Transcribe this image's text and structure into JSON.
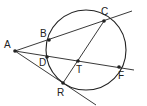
{
  "diagram": {
    "type": "geometry",
    "stroke_color": "#222222",
    "circle": {
      "cx": 86,
      "cy": 50,
      "r": 40
    },
    "points": [
      {
        "id": "A",
        "label": "A",
        "x": 15,
        "y": 51,
        "lx": 4,
        "ly": 48
      },
      {
        "id": "B",
        "label": "B",
        "x": 49,
        "y": 40,
        "lx": 40,
        "ly": 37
      },
      {
        "id": "C",
        "label": "C",
        "x": 104,
        "y": 21,
        "lx": 101,
        "ly": 15
      },
      {
        "id": "D",
        "label": "D",
        "x": 47,
        "y": 57,
        "lx": 39,
        "ly": 66
      },
      {
        "id": "T",
        "label": "T",
        "x": 78,
        "y": 61,
        "lx": 76,
        "ly": 73
      },
      {
        "id": "F",
        "label": "F",
        "x": 119,
        "y": 67,
        "lx": 118,
        "ly": 79
      },
      {
        "id": "R",
        "label": "R",
        "x": 63,
        "y": 83,
        "lx": 57,
        "ly": 96
      }
    ],
    "lines": [
      {
        "name": "secant-ABC",
        "x1": 15,
        "y1": 51,
        "x2": 132,
        "y2": 11
      },
      {
        "name": "secant-ADF",
        "x1": 15,
        "y1": 51,
        "x2": 134,
        "y2": 70
      },
      {
        "name": "tangent-AR",
        "x1": 15,
        "y1": 51,
        "x2": 96,
        "y2": 105
      },
      {
        "name": "chord-CR",
        "x1": 104,
        "y1": 21,
        "x2": 63,
        "y2": 83
      }
    ]
  }
}
